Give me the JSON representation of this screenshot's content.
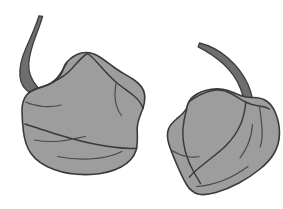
{
  "scene": {
    "title": "Two peppers illustration",
    "background_color": "#ffffff",
    "width": 283,
    "height": 209,
    "style": "flat grayscale line drawing",
    "object_count": 2
  },
  "palette": {
    "background": "#ffffff",
    "body_fill": "#9d9d9d",
    "body_shade": "#939393",
    "stem_fill": "#6e6e6e",
    "outline": "#3a3a3a",
    "inner_line": "#4a4a4a"
  },
  "objects": [
    {
      "id": "pepper-left",
      "name": "Left pepper",
      "kind": "pepper",
      "fill": "#9d9d9d",
      "outline": "#3a3a3a",
      "bounds": {
        "x": 18,
        "y": 15,
        "width": 128,
        "height": 160
      },
      "stem": {
        "id": "stem-left",
        "name": "Left pepper stem",
        "fill": "#6e6e6e",
        "curve": "upward hook curving left",
        "tip": {
          "x": 39,
          "y": 16
        },
        "base": {
          "x": 44,
          "y": 92
        }
      }
    },
    {
      "id": "pepper-right",
      "name": "Right pepper",
      "kind": "pepper",
      "fill": "#9d9d9d",
      "outline": "#3a3a3a",
      "bounds": {
        "x": 167,
        "y": 44,
        "width": 113,
        "height": 152
      },
      "stem": {
        "id": "stem-right",
        "name": "Right pepper stem",
        "fill": "#6e6e6e",
        "curve": "upward hook curving right",
        "tip": {
          "x": 198,
          "y": 47
        },
        "base": {
          "x": 249,
          "y": 112
        }
      }
    }
  ]
}
